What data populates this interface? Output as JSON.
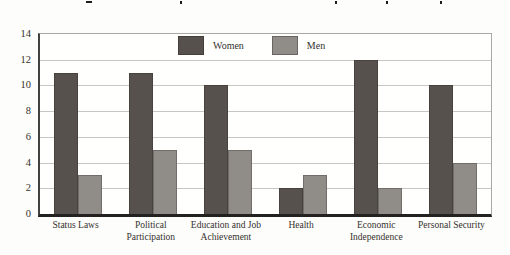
{
  "page": {
    "background": "#fdfdfb",
    "note_text": ""
  },
  "chart_data": {
    "type": "bar",
    "title": "",
    "xlabel": "",
    "ylabel": "",
    "categories": [
      "Status Laws",
      "Political Participation",
      "Education and Job Achievement",
      "Health",
      "Economic Independence",
      "Personal Security"
    ],
    "series": [
      {
        "name": "Women",
        "color": "#56514d",
        "values": [
          11,
          11,
          10,
          2,
          12,
          10
        ]
      },
      {
        "name": "Men",
        "color": "#908d89",
        "values": [
          3,
          5,
          5,
          3,
          2,
          4
        ]
      }
    ],
    "ylim": [
      0,
      14
    ],
    "yticks": [
      0,
      2,
      4,
      6,
      8,
      10,
      12,
      14
    ],
    "grid": true,
    "gridline_color": "#c7c6c2",
    "axis_color": "#232220",
    "legend_position": "top-center-inside"
  }
}
